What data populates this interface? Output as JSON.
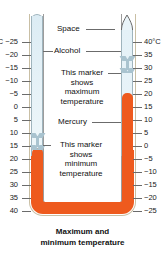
{
  "figure": {
    "title": "Maximum and minimum temperature",
    "caption_line1": "Maximum and",
    "caption_line2": "minimum temperature",
    "instrument": "Six's maximum and minimum thermometer"
  },
  "colors": {
    "mercury": "#ee5a1e",
    "alcohol": "#dcecf4",
    "glass_outline": "#c9bfa4",
    "tube_outline": "#9fb4bd",
    "marker": "#a9c3cf",
    "tick": "#6b6b6b",
    "text": "#111111",
    "background": "#ffffff"
  },
  "labels": {
    "space": "Space",
    "alcohol": "Alcohol",
    "mercury": "Mercury",
    "marker_max_line1": "This marker",
    "marker_max_line2": "shows",
    "marker_max_line3": "maximum",
    "marker_max_line4": "temperature",
    "marker_min_line1": "This marker",
    "marker_min_line2": "shows",
    "marker_min_line3": "minimum",
    "marker_min_line4": "temperature"
  },
  "scales": {
    "left": {
      "name": "minimum-scale",
      "unit": "°C",
      "unit_position": "top-left",
      "direction": "increasing-downward",
      "top_label": "−25",
      "ticks": [
        {
          "value": -25,
          "label": "−25"
        },
        {
          "value": -20,
          "label": "−20"
        },
        {
          "value": -15,
          "label": "−15"
        },
        {
          "value": -10,
          "label": "−10"
        },
        {
          "value": -5,
          "label": "−5"
        },
        {
          "value": 0,
          "label": "0"
        },
        {
          "value": 5,
          "label": "5"
        },
        {
          "value": 10,
          "label": "10"
        },
        {
          "value": 15,
          "label": "15"
        },
        {
          "value": 20,
          "label": "20"
        },
        {
          "value": 25,
          "label": "25"
        },
        {
          "value": 30,
          "label": "30"
        },
        {
          "value": 35,
          "label": "35"
        },
        {
          "value": 40,
          "label": "40"
        }
      ]
    },
    "right": {
      "name": "maximum-scale",
      "unit": "°C",
      "unit_position": "top-right",
      "direction": "decreasing-downward",
      "top_label": "40",
      "ticks": [
        {
          "value": 40,
          "label": "40"
        },
        {
          "value": 35,
          "label": "35"
        },
        {
          "value": 30,
          "label": "30"
        },
        {
          "value": 25,
          "label": "25"
        },
        {
          "value": 20,
          "label": "20"
        },
        {
          "value": 15,
          "label": "15"
        },
        {
          "value": 10,
          "label": "10"
        },
        {
          "value": 5,
          "label": "5"
        },
        {
          "value": 0,
          "label": "0"
        },
        {
          "value": -5,
          "label": "−5"
        },
        {
          "value": -10,
          "label": "−10"
        },
        {
          "value": -15,
          "label": "−15"
        },
        {
          "value": -20,
          "label": "−20"
        },
        {
          "value": -25,
          "label": "−25"
        }
      ]
    }
  },
  "readings": {
    "minimum_marker_value": "20",
    "minimum_marker_unit": "°C",
    "maximum_marker_value": "27",
    "maximum_marker_unit": "°C",
    "mercury_level_right": "15",
    "mercury_level_left": "20"
  }
}
